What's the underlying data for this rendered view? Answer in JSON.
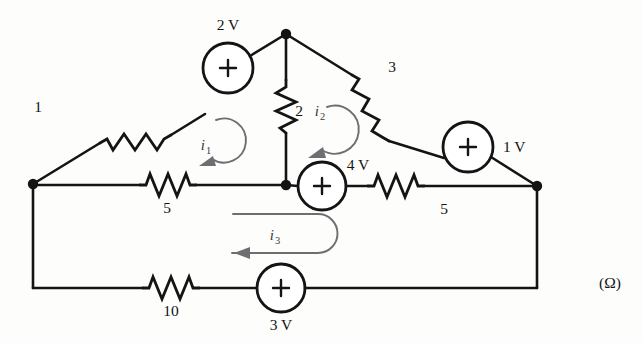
{
  "diagram": {
    "units_label": "(Ω)",
    "colors": {
      "wire": "#141414",
      "loop_arrow": "#6e6e72",
      "background": "#fdfdfb"
    },
    "nodes": [
      {
        "name": "top-node",
        "x": 286,
        "y": 34
      },
      {
        "name": "left-node",
        "x": 33,
        "y": 184
      },
      {
        "name": "center-node",
        "x": 286,
        "y": 185
      },
      {
        "name": "right-node",
        "x": 537,
        "y": 186
      }
    ],
    "resistors": [
      {
        "id": "r1",
        "label": "1",
        "value": 1,
        "unit": "Ω",
        "branch": "left-node to 2V source (upper-left diagonal)"
      },
      {
        "id": "r2",
        "label": "2",
        "value": 2,
        "unit": "Ω",
        "branch": "top-node to center-node (vertical middle)"
      },
      {
        "id": "r3",
        "label": "3",
        "value": 3,
        "unit": "Ω",
        "branch": "top-node to 1V source (upper-right diagonal)"
      },
      {
        "id": "r5a",
        "label": "5",
        "value": 5,
        "unit": "Ω",
        "branch": "left-node to center-node (middle-left horizontal)"
      },
      {
        "id": "r5b",
        "label": "5",
        "value": 5,
        "unit": "Ω",
        "branch": "4V source to right-node (middle-right horizontal)"
      },
      {
        "id": "r10",
        "label": "10",
        "value": 10,
        "unit": "Ω",
        "branch": "left-node to 3V source (bottom horizontal)"
      }
    ],
    "sources": [
      {
        "id": "v2",
        "label": "2 V",
        "value": 2,
        "unit": "V",
        "polarity": "+",
        "branch": "upper-left diagonal",
        "label_position": "above"
      },
      {
        "id": "v1",
        "label": "1 V",
        "value": 1,
        "unit": "V",
        "polarity": "+",
        "branch": "upper-right diagonal",
        "label_position": "right"
      },
      {
        "id": "v4",
        "label": "4 V",
        "value": 4,
        "unit": "V",
        "polarity": "+",
        "branch": "middle horizontal",
        "label_position": "above"
      },
      {
        "id": "v3",
        "label": "3 V",
        "value": 3,
        "unit": "V",
        "polarity": "+",
        "branch": "bottom horizontal",
        "label_position": "below"
      }
    ],
    "mesh_currents": [
      {
        "id": "i1",
        "symbol": "i",
        "subscript": "1",
        "direction": "counterclockwise",
        "shape": "circular-arc",
        "region": "left upper mesh"
      },
      {
        "id": "i2",
        "symbol": "i",
        "subscript": "2",
        "direction": "counterclockwise",
        "shape": "circular-arc",
        "region": "right upper mesh"
      },
      {
        "id": "i3",
        "symbol": "i",
        "subscript": "3",
        "direction": "counterclockwise",
        "shape": "u-turn",
        "region": "bottom mesh"
      }
    ]
  }
}
